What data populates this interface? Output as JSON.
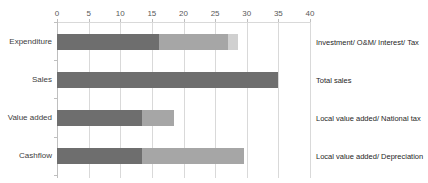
{
  "chart_data": {
    "type": "bar",
    "orientation": "horizontal",
    "stacked": true,
    "title": "",
    "xlabel": "",
    "ylabel": "",
    "xlim": [
      0,
      40
    ],
    "x_ticks": [
      0,
      5,
      10,
      15,
      20,
      25,
      30,
      35,
      40
    ],
    "x_axis_position": "top",
    "grid": true,
    "legend": null,
    "categories": [
      "Expenditure",
      "Sales",
      "Value added",
      "Cashflow"
    ],
    "category_annotations": [
      "Investment/ O&M/ Interest/ Tax",
      "Total sales",
      "Local value added/ National tax",
      "Local value added/ Depreciation"
    ],
    "bars": [
      {
        "category": "Expenditure",
        "segments": [
          16.2,
          10.9,
          1.5
        ]
      },
      {
        "category": "Sales",
        "segments": [
          35
        ]
      },
      {
        "category": "Value added",
        "segments": [
          13.4,
          5.1
        ]
      },
      {
        "category": "Cashflow",
        "segments": [
          13.4,
          16.1
        ]
      }
    ],
    "segment_colors": [
      "#6e6e6e",
      "#a6a6a6",
      "#d0d0d0"
    ]
  },
  "layout": {
    "x0_px": 57,
    "px_per_unit": 6.325,
    "bar_tops": [
      34,
      72,
      110,
      148
    ],
    "cat_tick_ys": [
      22,
      60,
      98,
      137,
      175
    ],
    "label_ys": [
      37,
      75,
      113,
      151
    ]
  }
}
